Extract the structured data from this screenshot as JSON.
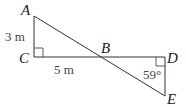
{
  "diagram": {
    "points": {
      "A": {
        "label": "A",
        "x": 34,
        "y": 16
      },
      "B": {
        "label": "B",
        "x": 99,
        "y": 57
      },
      "C": {
        "label": "C",
        "x": 34,
        "y": 57
      },
      "D": {
        "label": "D",
        "x": 165,
        "y": 57
      },
      "E": {
        "label": "E",
        "x": 165,
        "y": 96
      }
    },
    "measurements": {
      "AC": "3 m",
      "CB": "5 m",
      "angle_E": "59°"
    },
    "line_color": "#333333"
  }
}
